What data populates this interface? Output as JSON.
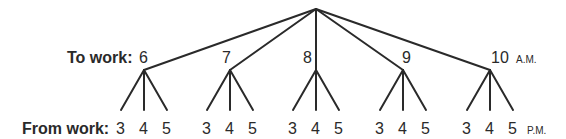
{
  "diagram": {
    "type": "tree",
    "root": {
      "x": 316,
      "y": 9
    },
    "row_labels": {
      "to_work": "To work:",
      "from_work": "From work:"
    },
    "to_work_times": [
      {
        "label": "6",
        "x": 144
      },
      {
        "label": "7",
        "x": 230
      },
      {
        "label": "8",
        "x": 316
      },
      {
        "label": "9",
        "x": 403
      },
      {
        "label": "10",
        "x": 490
      }
    ],
    "to_work_suffix": "A.M.",
    "from_work_times": [
      "3",
      "4",
      "5"
    ],
    "from_work_suffix": "P.M.",
    "line_color": "#2a2a2a"
  }
}
